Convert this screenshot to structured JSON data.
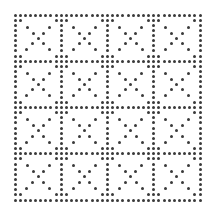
{
  "pattern": {
    "type": "dotted-grid-with-x",
    "rows": 4,
    "cols": 4,
    "origin": [
      15,
      15
    ],
    "cell_size": 46.25,
    "dot_spacing": 5.14,
    "dot_color": "#3a3a3a",
    "dot_diameter": 3,
    "background": "#ffffff",
    "border_steps_per_cell": 9,
    "corner_cluster_offset": 5.14,
    "x_mark_offsets": [
      12,
      18,
      23.1,
      28.5,
      34.5
    ]
  }
}
